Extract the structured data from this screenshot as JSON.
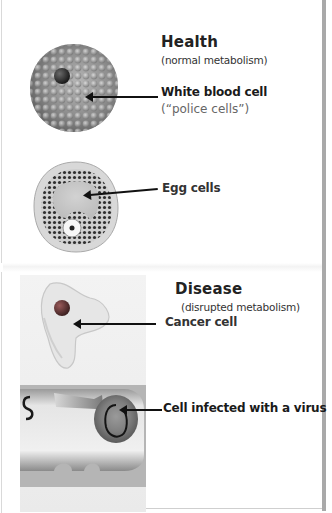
{
  "health": {
    "heading": "Health",
    "subheading": "(normal metabolism)",
    "white_blood_cell": {
      "label": "White blood cell",
      "note": "(“police cells”)"
    },
    "egg_cells": {
      "label": "Egg cells"
    }
  },
  "disease": {
    "heading": "Disease",
    "subheading": "(disrupted metabolism)",
    "cancer_cell": {
      "label": "Cancer cell"
    },
    "infected_cell": {
      "label": "Cell infected with a  virus"
    }
  },
  "icons": {
    "white_blood_cell": "white-blood-cell-illustration",
    "egg_cell": "egg-cell-illustration",
    "cancer_cell": "cancer-cell-illustration",
    "infected_cell": "virus-infected-cell-illustration"
  },
  "colors": {
    "text": "#1a1a1a",
    "note_text": "#666666",
    "border": "#a9a9a9",
    "cell_gray": "#8c8c8c",
    "nucleus_dark": "#3a3a3a",
    "cancer_nucleus": "#6e3b3b"
  }
}
